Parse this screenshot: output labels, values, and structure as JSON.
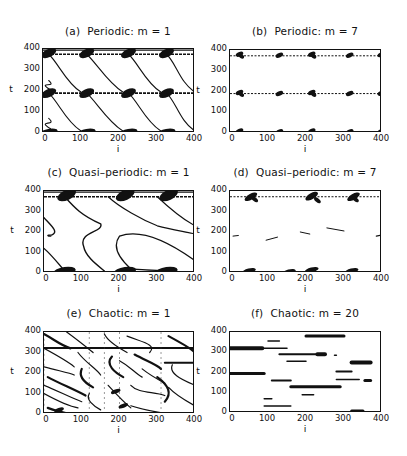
{
  "figure": {
    "panels": [
      {
        "id": "a",
        "title": "(a)  Periodic: m = 1",
        "xlabel": "i",
        "ylabel": "t"
      },
      {
        "id": "b",
        "title": "(b)  Periodic: m = 7",
        "xlabel": "i",
        "ylabel": "t"
      },
      {
        "id": "c",
        "title": "(c)  Quasi–periodic: m = 1",
        "xlabel": "i",
        "ylabel": "t"
      },
      {
        "id": "d",
        "title": "(d)  Quasi–periodic: m = 7",
        "xlabel": "i",
        "ylabel": "t"
      },
      {
        "id": "e",
        "title": "(e)  Chaotic: m = 1",
        "xlabel": "i",
        "ylabel": "t"
      },
      {
        "id": "f",
        "title": "(f)  Chaotic: m = 20",
        "xlabel": "i",
        "ylabel": "t"
      }
    ],
    "xticks": [
      "0",
      "100",
      "200",
      "300",
      "400"
    ],
    "yticks": [
      "400",
      "300",
      "200",
      "100",
      "0"
    ]
  },
  "chart_data": [
    {
      "type": "scatter",
      "title": "(a) Periodic: m = 1",
      "xlabel": "i",
      "ylabel": "t",
      "xlim": [
        0,
        400
      ],
      "ylim": [
        0,
        400
      ],
      "grid": false,
      "description": "Space-time pattern: horizontal bands at t≈0, 190, 375 with dark blobs at i≈0,100,210,310,400; diagonal lines descending left-to-right between bands"
    },
    {
      "type": "scatter",
      "title": "(b) Periodic: m = 7",
      "xlabel": "i",
      "ylabel": "t",
      "xlim": [
        0,
        400
      ],
      "ylim": [
        0,
        400
      ],
      "grid": false,
      "description": "Horizontal dotted lines at t≈0, 190, 375 with small blobs at i≈20,130,210,310,400"
    },
    {
      "type": "scatter",
      "title": "(c) Quasi-periodic: m = 1",
      "xlabel": "i",
      "ylabel": "t",
      "xlim": [
        0,
        400
      ],
      "ylim": [
        0,
        400
      ],
      "grid": false,
      "description": "Band at t≈375 and t≈0 with blobs at i≈50,210,320; curved S-shaped trajectories in between"
    },
    {
      "type": "scatter",
      "title": "(d) Quasi-periodic: m = 7",
      "xlabel": "i",
      "ylabel": "t",
      "xlim": [
        0,
        400
      ],
      "ylim": [
        0,
        400
      ],
      "grid": false,
      "description": "Line at t≈375 with blobs at i≈50,210,320; faint short segments near t≈160-220; blobs at t≈0"
    },
    {
      "type": "scatter",
      "title": "(e) Chaotic: m = 1",
      "xlabel": "i",
      "ylabel": "t",
      "xlim": [
        0,
        400
      ],
      "ylim": [
        0,
        400
      ],
      "grid": false,
      "description": "Dense irregular curved filaments across the whole domain; horizontal bands at t≈320 and t≈250 (i>320)"
    },
    {
      "type": "scatter",
      "title": "(f) Chaotic: m = 20",
      "xlabel": "i",
      "ylabel": "t",
      "xlim": [
        0,
        400
      ],
      "ylim": [
        0,
        400
      ],
      "grid": false,
      "description": "Sparse horizontal streaks at various t (≈0, 30, 60, 90, 130, 160, 200, 250, 290, 320, 350, 380)"
    }
  ]
}
